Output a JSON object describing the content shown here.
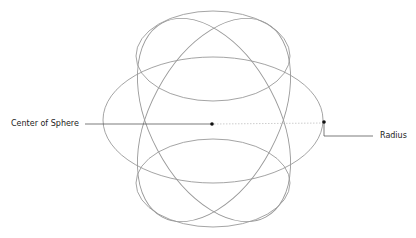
{
  "labels": {
    "center": "Center of Sphere",
    "radius": "Radius"
  },
  "colors": {
    "curve": "#9a9a9a",
    "leader": "#444444",
    "dot": "#111111",
    "radius_dash": "#b8b8b8"
  },
  "geometry": {
    "center": {
      "x": 213,
      "y": 123
    },
    "radius_point": {
      "x": 324,
      "y": 122
    },
    "ellipses": [
      {
        "name": "top",
        "cx": 213,
        "cy": 56,
        "rx": 77,
        "ry": 45,
        "rotate": 0
      },
      {
        "name": "bottom",
        "cx": 213,
        "cy": 183,
        "rx": 77,
        "ry": 44,
        "rotate": 0
      },
      {
        "name": "equator",
        "cx": 213,
        "cy": 120,
        "rx": 110,
        "ry": 63,
        "rotate": 0
      },
      {
        "name": "tilted-left",
        "cx": 214,
        "cy": 120,
        "rx": 64,
        "ry": 110,
        "rotate": -28
      },
      {
        "name": "tilted-right",
        "cx": 214,
        "cy": 120,
        "rx": 64,
        "ry": 110,
        "rotate": 28
      }
    ]
  }
}
